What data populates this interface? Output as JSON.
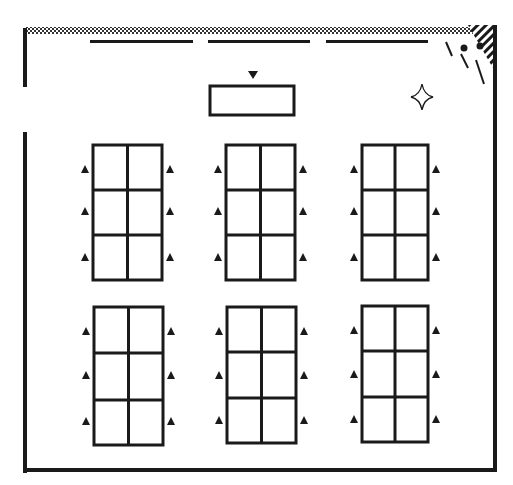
{
  "diagram": {
    "type": "classroom-seating-plan",
    "colors": {
      "ink": "#1a1a1a",
      "background": "#ffffff"
    },
    "room": {
      "walls": "rectangular",
      "door": "left wall, upper section",
      "window_wall": "top (dotted)",
      "corner_feature": "hatched top-right corner with plant"
    },
    "board": {
      "segments": 3
    },
    "teacher_desk": {
      "marker": "triangle-down-icon"
    },
    "decoration": {
      "icon": "four-point-star-icon",
      "position": "top-right"
    },
    "table_groups": {
      "rows": 2,
      "columns": 3,
      "cells_per_table": 6,
      "seats_per_table": 6,
      "seat_marker": "triangle-up-icon"
    }
  }
}
